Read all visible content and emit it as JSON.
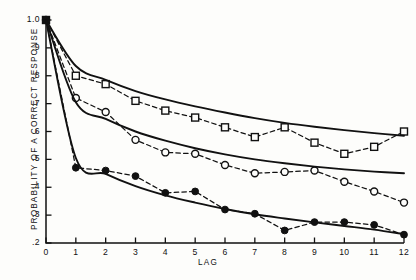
{
  "figure": {
    "background": "#fdfdfb",
    "ink_color": "#111111"
  },
  "axes": {
    "ylabel": "PROBABILITY OF A CORRECT RESPONSE",
    "xlabel": "LAG",
    "y_ticks": [
      ".2",
      ".3",
      ".4",
      ".5",
      ".6",
      ".7",
      ".8",
      ".9",
      "1.0"
    ],
    "x_ticks": [
      "0",
      "1",
      "2",
      "3",
      "4",
      "5",
      "6",
      "7",
      "8",
      "9",
      "10",
      "11",
      "12"
    ]
  },
  "chart_data": {
    "type": "line",
    "title": "",
    "subtitle": "",
    "xlabel": "LAG",
    "ylabel": "PROBABILITY OF A CORRECT RESPONSE",
    "xlim": [
      0,
      12
    ],
    "ylim": [
      0.2,
      1.0
    ],
    "x_tick_values": [
      0,
      1,
      2,
      3,
      4,
      5,
      6,
      7,
      8,
      9,
      10,
      11,
      12
    ],
    "y_tick_values": [
      0.2,
      0.3,
      0.4,
      0.5,
      0.6,
      0.7,
      0.8,
      0.9,
      1.0
    ],
    "y_tick_labels": [
      ".2",
      ".3",
      ".4",
      ".5",
      ".6",
      ".7",
      ".8",
      ".9",
      "1.0"
    ],
    "grid": false,
    "legend": null,
    "legend_position": "none",
    "annotations": [],
    "x": [
      0,
      1,
      2,
      3,
      4,
      5,
      6,
      7,
      8,
      9,
      10,
      11,
      12
    ],
    "series": [
      {
        "name": "observed-open-square",
        "marker": "open-square",
        "linestyle": "dashed",
        "color": "#111111",
        "values": [
          1.0,
          0.8,
          0.77,
          0.71,
          0.675,
          0.65,
          0.615,
          0.58,
          0.615,
          0.56,
          0.52,
          0.545,
          0.6
        ]
      },
      {
        "name": "observed-open-circle",
        "marker": "open-circle",
        "linestyle": "dashed",
        "color": "#111111",
        "values": [
          1.0,
          0.72,
          0.67,
          0.57,
          0.525,
          0.52,
          0.48,
          0.45,
          0.455,
          0.46,
          0.42,
          0.385,
          0.345
        ]
      },
      {
        "name": "observed-filled-circle",
        "marker": "filled-circle",
        "linestyle": "dashed",
        "color": "#111111",
        "values": [
          1.0,
          0.47,
          0.46,
          0.44,
          0.38,
          0.385,
          0.32,
          0.305,
          0.245,
          0.275,
          0.275,
          0.265,
          0.23
        ]
      },
      {
        "name": "predicted-upper",
        "marker": "none",
        "linestyle": "solid",
        "color": "#111111",
        "values": [
          1.0,
          0.835,
          0.785,
          0.745,
          0.715,
          0.69,
          0.668,
          0.648,
          0.631,
          0.617,
          0.605,
          0.594,
          0.585
        ]
      },
      {
        "name": "predicted-middle",
        "marker": "none",
        "linestyle": "solid",
        "color": "#111111",
        "values": [
          1.0,
          0.705,
          0.645,
          0.6,
          0.567,
          0.54,
          0.518,
          0.5,
          0.486,
          0.474,
          0.464,
          0.456,
          0.45
        ]
      },
      {
        "name": "predicted-lower",
        "marker": "none",
        "linestyle": "solid",
        "color": "#111111",
        "values": [
          1.0,
          0.505,
          0.448,
          0.404,
          0.371,
          0.345,
          0.322,
          0.303,
          0.288,
          0.274,
          0.261,
          0.248,
          0.232
        ]
      }
    ]
  }
}
